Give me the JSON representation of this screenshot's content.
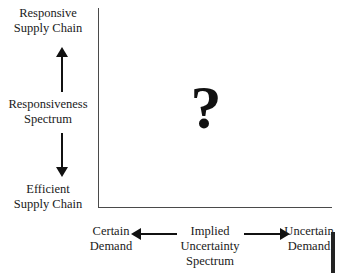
{
  "diagram": {
    "background_color": "#ffffff",
    "line_color": "#4a4a4a",
    "arrow_color": "#111111",
    "text_color": "#1a1a1a",
    "vertical_axis": {
      "name": "responsiveness-spectrum",
      "spectrum_label_line1": "Responsiveness",
      "spectrum_label_line2": "Spectrum",
      "top_label_line1": "Responsive",
      "top_label_line2": "Supply Chain",
      "bottom_label_line1": "Efficient",
      "bottom_label_line2": "Supply Chain"
    },
    "horizontal_axis": {
      "name": "implied-uncertainty-spectrum",
      "spectrum_label_line1": "Implied",
      "spectrum_label_line2": "Uncertainty",
      "spectrum_label_line3": "Spectrum",
      "left_label_line1": "Certain",
      "left_label_line2": "Demand",
      "right_label_line1": "Uncertain",
      "right_label_line2": "Demand"
    },
    "plot_area": {
      "marker": "?",
      "marker_name": "question-mark"
    }
  }
}
